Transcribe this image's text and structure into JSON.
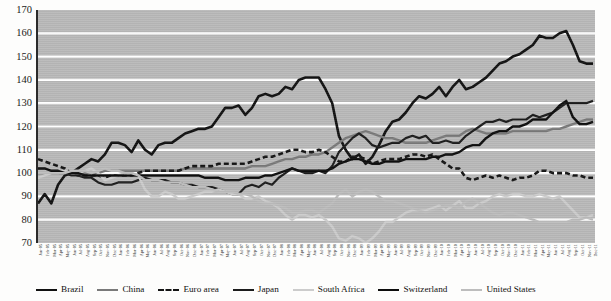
{
  "chart_data": {
    "type": "line",
    "title": "",
    "subtitle": "",
    "xlabel": "",
    "ylabel": "",
    "ylim": [
      70,
      170
    ],
    "ytick_step": 10,
    "yticks": [
      170,
      160,
      150,
      140,
      130,
      120,
      110,
      100,
      90,
      80,
      70
    ],
    "grid": true,
    "grid_color": "#ffffff",
    "plot_background": "#b9b9b9",
    "legend_position": "bottom",
    "index_base": 100,
    "x": [
      "Jan-05",
      "Feb-05",
      "Mar-05",
      "Apr-05",
      "May-05",
      "Jun-05",
      "Jul-05",
      "Aug-05",
      "Sep-05",
      "Oct-05",
      "Nov-05",
      "Dec-05",
      "Jan-06",
      "Feb-06",
      "Mar-06",
      "Apr-06",
      "May-06",
      "Jun-06",
      "Jul-06",
      "Aug-06",
      "Sep-06",
      "Oct-06",
      "Nov-06",
      "Dec-06",
      "Jan-07",
      "Feb-07",
      "Mar-07",
      "Apr-07",
      "May-07",
      "Jun-07",
      "Jul-07",
      "Aug-07",
      "Sep-07",
      "Oct-07",
      "Nov-07",
      "Dec-07",
      "Jan-08",
      "Feb-08",
      "Mar-08",
      "Apr-08",
      "May-08",
      "Jun-08",
      "Jul-08",
      "Aug-08",
      "Sep-08",
      "Oct-08",
      "Nov-08",
      "Dec-08",
      "Jan-09",
      "Feb-09",
      "Mar-09",
      "Apr-09",
      "May-09",
      "Jun-09",
      "Jul-09",
      "Aug-09",
      "Sep-09",
      "Oct-09",
      "Nov-09",
      "Dec-09",
      "Jan-10",
      "Feb-10",
      "Mar-10",
      "Apr-10",
      "May-10",
      "Jun-10",
      "Jul-10",
      "Aug-10",
      "Sep-10",
      "Oct-10",
      "Nov-10",
      "Dec-10",
      "Jan-11",
      "Feb-11",
      "Mar-11",
      "Apr-11",
      "May-11",
      "Jun-11",
      "Jul-11",
      "Aug-11",
      "Sep-11",
      "Oct-11",
      "Nov-11",
      "Dec-11"
    ],
    "series": [
      {
        "name": "Brazil",
        "color": "#111111",
        "width": 2.6,
        "dash": "none",
        "values": [
          87,
          91,
          87,
          95,
          99,
          100,
          102,
          104,
          106,
          105,
          108,
          113,
          113,
          112,
          109,
          114,
          110,
          108,
          112,
          113,
          113,
          115,
          117,
          118,
          119,
          119,
          120,
          124,
          128,
          128,
          129,
          125,
          128,
          133,
          134,
          133,
          134,
          137,
          136,
          140,
          141,
          141,
          141,
          136,
          130,
          116,
          110,
          106,
          108,
          104,
          107,
          112,
          118,
          122,
          123,
          126,
          130,
          133,
          132,
          134,
          137,
          133,
          137,
          140,
          136,
          137,
          139,
          141,
          144,
          147,
          148,
          150,
          151,
          153,
          155,
          159,
          158,
          158,
          160,
          161,
          155,
          148,
          147,
          147
        ]
      },
      {
        "name": "China",
        "color": "#7a7a7a",
        "width": 2.4,
        "dash": "none",
        "values": [
          100,
          100,
          100,
          100,
          100,
          100,
          100,
          100,
          100,
          100,
          101,
          101,
          101,
          101,
          101,
          101,
          101,
          101,
          101,
          101,
          101,
          101,
          102,
          102,
          102,
          102,
          102,
          102,
          102,
          102,
          102,
          102,
          103,
          103,
          103,
          104,
          105,
          106,
          106,
          107,
          107,
          108,
          108,
          109,
          111,
          113,
          115,
          116,
          117,
          118,
          117,
          116,
          115,
          115,
          114,
          113,
          113,
          113,
          113,
          114,
          115,
          116,
          116,
          116,
          118,
          119,
          118,
          117,
          117,
          117,
          117,
          118,
          118,
          118,
          118,
          118,
          118,
          119,
          119,
          120,
          121,
          122,
          123,
          123
        ]
      },
      {
        "name": "Euro area",
        "color": "#141414",
        "width": 2.6,
        "dash": "5,3",
        "values": [
          106,
          105,
          104,
          103,
          102,
          100,
          99,
          99,
          99,
          99,
          98,
          99,
          99,
          99,
          99,
          100,
          101,
          101,
          101,
          101,
          101,
          101,
          102,
          103,
          103,
          103,
          103,
          104,
          104,
          104,
          104,
          104,
          105,
          106,
          107,
          107,
          108,
          109,
          110,
          110,
          109,
          109,
          110,
          109,
          107,
          105,
          105,
          107,
          107,
          106,
          104,
          105,
          106,
          106,
          106,
          107,
          108,
          108,
          107,
          108,
          106,
          104,
          102,
          102,
          98,
          97,
          98,
          99,
          98,
          99,
          98,
          97,
          98,
          98,
          99,
          101,
          101,
          100,
          100,
          100,
          99,
          99,
          98,
          98
        ]
      },
      {
        "name": "Japan",
        "color": "#1c1c1c",
        "width": 2.2,
        "dash": "none",
        "values": [
          100,
          100,
          100,
          100,
          100,
          99,
          99,
          98,
          98,
          96,
          95,
          95,
          96,
          96,
          96,
          97,
          98,
          97,
          97,
          97,
          96,
          96,
          95,
          95,
          94,
          94,
          94,
          93,
          92,
          91,
          91,
          94,
          95,
          94,
          96,
          95,
          98,
          100,
          102,
          101,
          100,
          100,
          101,
          100,
          103,
          109,
          112,
          115,
          117,
          115,
          112,
          111,
          112,
          113,
          113,
          115,
          116,
          115,
          116,
          113,
          113,
          114,
          113,
          113,
          116,
          118,
          120,
          122,
          122,
          123,
          122,
          123,
          123,
          123,
          125,
          124,
          125,
          126,
          128,
          130,
          130,
          130,
          130,
          131
        ]
      },
      {
        "name": "South Africa",
        "color": "#cccccc",
        "width": 2.4,
        "dash": "none",
        "values": [
          98,
          99,
          100,
          100,
          101,
          100,
          100,
          101,
          102,
          100,
          97,
          98,
          99,
          100,
          100,
          99,
          93,
          90,
          90,
          92,
          91,
          89,
          89,
          90,
          91,
          92,
          92,
          93,
          92,
          91,
          91,
          89,
          89,
          90,
          88,
          87,
          85,
          82,
          80,
          82,
          82,
          81,
          82,
          80,
          77,
          72,
          71,
          73,
          72,
          70,
          72,
          75,
          79,
          79,
          81,
          83,
          84,
          84,
          84,
          85,
          86,
          84,
          86,
          88,
          85,
          85,
          87,
          88,
          90,
          91,
          90,
          91,
          91,
          90,
          90,
          91,
          90,
          89,
          90,
          87,
          84,
          81,
          81,
          82
        ]
      },
      {
        "name": "Switzerland",
        "color": "#0d0d0d",
        "width": 2.4,
        "dash": "none",
        "values": [
          102,
          102,
          101,
          101,
          100,
          100,
          100,
          99,
          99,
          99,
          99,
          99,
          99,
          99,
          99,
          99,
          99,
          99,
          99,
          99,
          99,
          99,
          99,
          99,
          99,
          98,
          98,
          98,
          97,
          97,
          97,
          98,
          98,
          98,
          99,
          99,
          100,
          101,
          102,
          101,
          101,
          101,
          101,
          101,
          102,
          104,
          105,
          106,
          106,
          105,
          104,
          104,
          105,
          105,
          105,
          106,
          106,
          106,
          106,
          107,
          107,
          108,
          108,
          109,
          111,
          112,
          112,
          115,
          117,
          118,
          118,
          120,
          120,
          121,
          123,
          123,
          123,
          126,
          129,
          131,
          124,
          121,
          121,
          122
        ]
      },
      {
        "name": "United States",
        "color": "#bdbdbd",
        "width": 2.4,
        "dash": "none",
        "values": [
          100,
          100,
          100,
          100,
          100,
          101,
          101,
          101,
          100,
          101,
          102,
          101,
          101,
          100,
          100,
          99,
          97,
          97,
          97,
          96,
          96,
          96,
          95,
          94,
          94,
          94,
          93,
          92,
          92,
          92,
          91,
          91,
          90,
          88,
          87,
          87,
          86,
          85,
          83,
          83,
          84,
          84,
          83,
          85,
          87,
          91,
          93,
          90,
          92,
          93,
          92,
          90,
          88,
          88,
          87,
          86,
          85,
          84,
          83,
          84,
          85,
          86,
          86,
          85,
          88,
          89,
          87,
          85,
          83,
          82,
          83,
          83,
          82,
          81,
          80,
          79,
          79,
          79,
          79,
          79,
          80,
          80,
          81,
          80
        ]
      }
    ]
  },
  "legend": {
    "items": [
      {
        "label": "Brazil",
        "color": "#111111",
        "dashed": false
      },
      {
        "label": "China",
        "color": "#7a7a7a",
        "dashed": false
      },
      {
        "label": "Euro area",
        "color": "#141414",
        "dashed": true
      },
      {
        "label": "Japan",
        "color": "#1c1c1c",
        "dashed": false
      },
      {
        "label": "South Africa",
        "color": "#cccccc",
        "dashed": false
      },
      {
        "label": "Switzerland",
        "color": "#0d0d0d",
        "dashed": false
      },
      {
        "label": "United States",
        "color": "#bdbdbd",
        "dashed": false
      }
    ]
  }
}
